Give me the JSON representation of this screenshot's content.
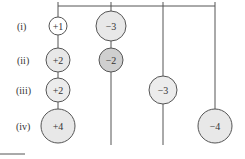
{
  "diagram": {
    "type": "hanging-mobile-charges",
    "colors": {
      "line": "#555555",
      "circle_light": "#e8e8e8",
      "circle_dark": "#cfcfcf",
      "circle_white": "#ffffff",
      "text": "#333333"
    },
    "rows": [
      {
        "label": "(i)"
      },
      {
        "label": "(ii)"
      },
      {
        "label": "(iii)"
      },
      {
        "label": "(iv)"
      }
    ],
    "columns": [
      {
        "nodes": [
          {
            "value": "+1",
            "row": 0
          },
          {
            "value": "+2",
            "row": 1
          },
          {
            "value": "+2",
            "row": 2
          },
          {
            "value": "+4",
            "row": 3
          }
        ]
      },
      {
        "nodes": [
          {
            "value": "−3",
            "row": 0
          },
          {
            "value": "−2",
            "row": 1
          }
        ]
      },
      {
        "nodes": [
          {
            "value": "−3",
            "row": 2
          }
        ]
      },
      {
        "nodes": [
          {
            "value": "−4",
            "row": 3
          }
        ]
      }
    ]
  }
}
